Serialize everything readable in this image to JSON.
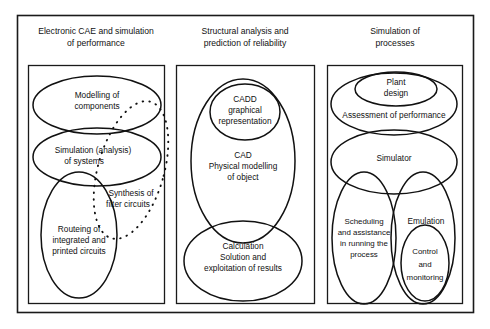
{
  "diagram": {
    "type": "venn-panels",
    "title": "",
    "background_color": "#ffffff",
    "stroke_color": "#111111",
    "panels": [
      {
        "id": "panel-electronic-cae",
        "title_line1": "Electronic CAE and simulation",
        "title_line2": "of performance",
        "sets": [
          {
            "id": "modelling-of-components",
            "style": "solid",
            "lines": [
              "Modelling of",
              "components"
            ]
          },
          {
            "id": "simulation-analysis-of-systems",
            "style": "solid",
            "lines": [
              "Simulation  (analysis)",
              "of systems"
            ]
          },
          {
            "id": "routeing-of-integrated-and-printed-circuits",
            "style": "solid",
            "lines": [
              "Routeing of",
              "integrated and",
              "printed circuits"
            ]
          },
          {
            "id": "synthesis-of-filter-circuits",
            "style": "dotted",
            "lines": [
              "Synthesis of",
              "filter circuits"
            ]
          }
        ]
      },
      {
        "id": "panel-structural-analysis",
        "title_line1": "Structural analysis and",
        "title_line2": "prediction of reliability",
        "sets": [
          {
            "id": "cadd-graphical-representation",
            "style": "solid",
            "lines": [
              "CADD",
              "graphical",
              "representation"
            ]
          },
          {
            "id": "cad-physical-modelling-of-object",
            "style": "solid",
            "lines": [
              "CAD",
              "Physical modelling",
              "of object"
            ]
          },
          {
            "id": "calculation-solution-and-exploitation-of-results",
            "style": "solid",
            "lines": [
              "Calculation",
              "Solution and",
              "exploitation of results"
            ]
          }
        ]
      },
      {
        "id": "panel-simulation-of-processes",
        "title_line1": "Simulation of",
        "title_line2": "processes",
        "sets": [
          {
            "id": "plant-design",
            "style": "solid",
            "lines": [
              "Plant",
              "design"
            ]
          },
          {
            "id": "assessment-of-performance",
            "style": "solid",
            "lines": [
              "Assessment of  performance"
            ]
          },
          {
            "id": "simulator",
            "style": "solid",
            "lines": [
              "Simulator"
            ]
          },
          {
            "id": "scheduling-and-assistance",
            "style": "solid",
            "lines": [
              "Scheduling",
              "and assistance",
              "in running the",
              "process"
            ]
          },
          {
            "id": "emulation",
            "style": "solid",
            "lines": [
              "Emulation"
            ]
          },
          {
            "id": "control-and-monitoring",
            "style": "solid",
            "lines": [
              "Control",
              "and",
              "monitoring"
            ]
          }
        ]
      }
    ]
  },
  "labels": {
    "p1_title_1": "Electronic CAE and simulation",
    "p1_title_2": "of performance",
    "p2_title_1": "Structural analysis and",
    "p2_title_2": "prediction of reliability",
    "p3_title_1": "Simulation of",
    "p3_title_2": "processes",
    "modelling_1": "Modelling of",
    "modelling_2": "components",
    "simulation_1": "Simulation  (analysis)",
    "simulation_2": "of systems",
    "routeing_1": "Routeing of",
    "routeing_2": "integrated and",
    "routeing_3": "printed circuits",
    "synthesis_1": "Synthesis of",
    "synthesis_2": "filter circuits",
    "cadd_1": "CADD",
    "cadd_2": "graphical",
    "cadd_3": "representation",
    "cad_1": "CAD",
    "cad_2": "Physical modelling",
    "cad_3": "of object",
    "calc_1": "Calculation",
    "calc_2": "Solution and",
    "calc_3": "exploitation of results",
    "plant_1": "Plant",
    "plant_2": "design",
    "assessment_1": "Assessment of  performance",
    "simulator_1": "Simulator",
    "scheduling_1": "Scheduling",
    "scheduling_2": "and assistance",
    "scheduling_3": "in running the",
    "scheduling_4": "process",
    "emulation_1": "Emulation",
    "control_1": "Control",
    "control_2": "and",
    "control_3": "monitoring"
  }
}
